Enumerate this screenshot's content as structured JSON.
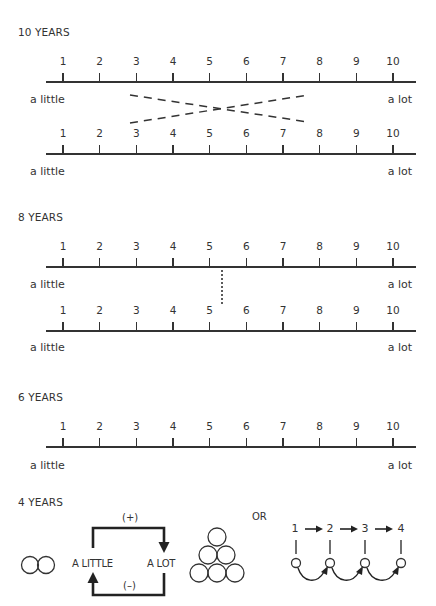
{
  "sections": [
    {
      "title": "10 YEARS",
      "scales": [
        {
          "ticks": [
            "1",
            "2",
            "3",
            "4",
            "5",
            "6",
            "7",
            "8",
            "9",
            "10"
          ]
        },
        {
          "ticks": [
            "1",
            "2",
            "3",
            "4",
            "5",
            "6",
            "7",
            "8",
            "9",
            "10"
          ]
        }
      ],
      "labels": [
        {
          "left": "a little",
          "right": "a lot"
        },
        {
          "left": "a little",
          "right": "a lot"
        }
      ],
      "annotation": "dashed crossing lines linking 3 and 8 on upper scale with 8 and 3 on lower scale"
    },
    {
      "title": "8 YEARS",
      "scales": [
        {
          "ticks": [
            "1",
            "2",
            "3",
            "4",
            "5",
            "6",
            "7",
            "8",
            "9",
            "10"
          ]
        },
        {
          "ticks": [
            "1",
            "2",
            "3",
            "4",
            "5",
            "6",
            "7",
            "8",
            "9",
            "10"
          ]
        }
      ],
      "labels": [
        {
          "left": "a little",
          "right": "a lot"
        },
        {
          "left": "a little",
          "right": "a lot"
        }
      ],
      "annotation": "dotted vertical line near midpoint between 5 and 6"
    },
    {
      "title": "6 YEARS",
      "scales": [
        {
          "ticks": [
            "1",
            "2",
            "3",
            "4",
            "5",
            "6",
            "7",
            "8",
            "9",
            "10"
          ]
        }
      ],
      "labels": [
        {
          "left": "a little",
          "right": "a lot"
        }
      ]
    },
    {
      "title": "4 YEARS",
      "loop": {
        "plus_label": "(+)",
        "minus_label": "(–)",
        "left_label": "A LITTLE",
        "right_label": "A LOT"
      },
      "or_label": "OR",
      "chain": [
        "1",
        "2",
        "3",
        "4"
      ],
      "icons": {
        "small_set": "two-circles-icon",
        "large_set": "six-circles-triangle-icon"
      }
    }
  ]
}
